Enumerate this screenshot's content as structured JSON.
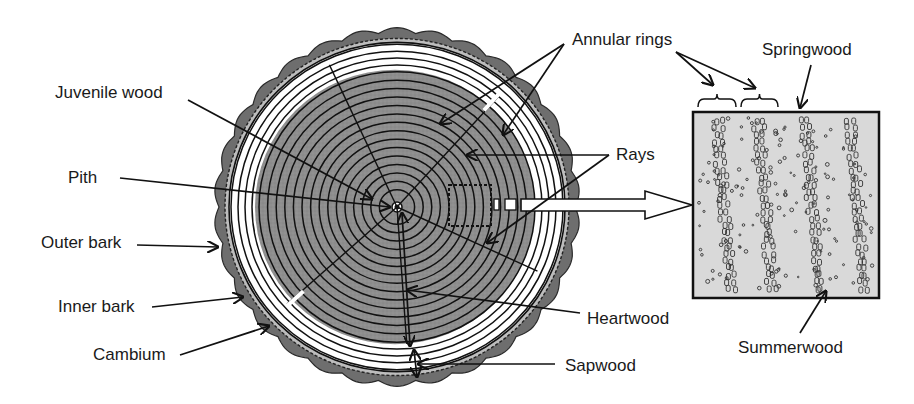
{
  "colors": {
    "background": "#ffffff",
    "bark": "#6e6e6e",
    "bark_outline": "#2a2a2a",
    "heartwood": "#8c8c8c",
    "juvenile_core": "#a6a6a6",
    "sapwood": "#ffffff",
    "ring_line": "#111111",
    "detail_fill": "#d9d9d9",
    "text": "#1a1a1a"
  },
  "trunk": {
    "center": [
      397,
      207
    ],
    "bark_outer_radius": 182,
    "inner_bark_radius": 172,
    "cambium_radius": 168,
    "sapwood_outer_radius": 166,
    "heartwood_radius": 140,
    "juvenile_radius": 55,
    "ring_count_heartwood": 15,
    "ring_count_sapwood": 4
  },
  "detail_box": {
    "x": 693,
    "y": 112,
    "width": 186,
    "height": 186,
    "late_wood_bands_x": [
      712,
      753,
      800,
      845
    ]
  },
  "labels": [
    {
      "id": "juvenile-wood",
      "text": "Juvenile wood",
      "x": 55,
      "y": 98,
      "anchor": "start"
    },
    {
      "id": "pith",
      "text": "Pith",
      "x": 68,
      "y": 183,
      "anchor": "start"
    },
    {
      "id": "outer-bark",
      "text": "Outer bark",
      "x": 41,
      "y": 248,
      "anchor": "start"
    },
    {
      "id": "inner-bark",
      "text": "Inner bark",
      "x": 58,
      "y": 312,
      "anchor": "start"
    },
    {
      "id": "cambium",
      "text": "Cambium",
      "x": 93,
      "y": 360,
      "anchor": "start"
    },
    {
      "id": "annular-rings",
      "text": "Annular rings",
      "x": 572,
      "y": 45,
      "anchor": "start"
    },
    {
      "id": "springwood",
      "text": "Springwood",
      "x": 762,
      "y": 55,
      "anchor": "start"
    },
    {
      "id": "rays",
      "text": "Rays",
      "x": 616,
      "y": 160,
      "anchor": "start"
    },
    {
      "id": "heartwood",
      "text": "Heartwood",
      "x": 587,
      "y": 324,
      "anchor": "start"
    },
    {
      "id": "sapwood",
      "text": "Sapwood",
      "x": 565,
      "y": 371,
      "anchor": "start"
    },
    {
      "id": "summerwood",
      "text": "Summerwood",
      "x": 738,
      "y": 353,
      "anchor": "start"
    }
  ],
  "pointers": [
    {
      "id": "juvenile-wood-pointer",
      "from": [
        188,
        100
      ],
      "to": [
        372,
        199
      ]
    },
    {
      "id": "pith-pointer",
      "from": [
        120,
        178
      ],
      "to": [
        390,
        207
      ]
    },
    {
      "id": "outer-bark-pointer",
      "from": [
        137,
        245
      ],
      "to": [
        218,
        247
      ]
    },
    {
      "id": "inner-bark-pointer",
      "from": [
        152,
        307
      ],
      "to": [
        243,
        297
      ]
    },
    {
      "id": "cambium-pointer",
      "from": [
        180,
        355
      ],
      "to": [
        269,
        326
      ]
    },
    {
      "id": "annular-rings-pointer-a",
      "from": [
        564,
        44
      ],
      "to": [
        440,
        124
      ]
    },
    {
      "id": "annular-rings-pointer-b",
      "from": [
        564,
        44
      ],
      "to": [
        503,
        135
      ]
    },
    {
      "id": "rays-pointer-a",
      "from": [
        609,
        155
      ],
      "to": [
        467,
        155
      ]
    },
    {
      "id": "rays-pointer-b",
      "from": [
        609,
        155
      ],
      "to": [
        487,
        243
      ]
    },
    {
      "id": "heartwood-pointer",
      "from": [
        580,
        313
      ],
      "to": [
        407,
        290
      ]
    },
    {
      "id": "sapwood-pointer",
      "from": [
        555,
        364
      ],
      "to": [
        418,
        364
      ]
    },
    {
      "id": "summerwood-pointer",
      "from": [
        800,
        333
      ],
      "to": [
        826,
        291
      ]
    },
    {
      "id": "springwood-pointer",
      "from": [
        811,
        65
      ],
      "to": [
        800,
        108
      ]
    },
    {
      "id": "annular-rings-right-a",
      "from": [
        676,
        52
      ],
      "to": [
        713,
        85
      ]
    },
    {
      "id": "annular-rings-right-b",
      "from": [
        676,
        52
      ],
      "to": [
        755,
        88
      ]
    }
  ],
  "brackets": [
    {
      "x1": 698,
      "x2": 736,
      "y": 99
    },
    {
      "x1": 741,
      "x2": 778,
      "y": 99
    }
  ]
}
